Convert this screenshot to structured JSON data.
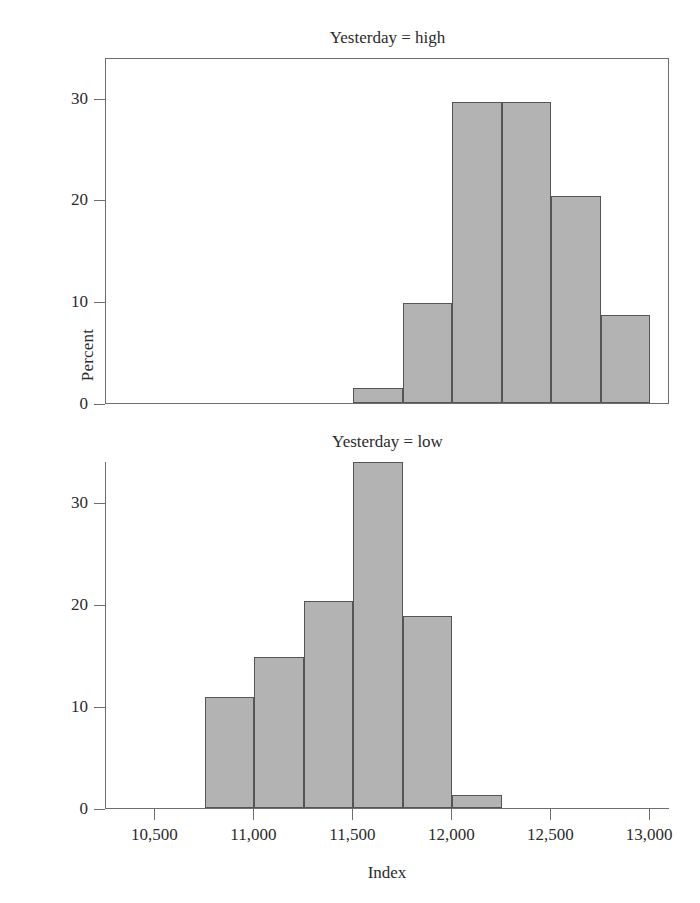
{
  "figure": {
    "xlabel": "Index",
    "ylabel": "Percent"
  },
  "chart_data": [
    {
      "type": "bar",
      "title": "Yesterday = high",
      "xlabel": "Index",
      "ylabel": "Percent",
      "xlim": [
        10250,
        13100
      ],
      "ylim": [
        0,
        34
      ],
      "xticks": [
        10500,
        11000,
        11500,
        12000,
        12500,
        13000
      ],
      "xticklabels": [
        "10,500",
        "11,000",
        "11,500",
        "12,000",
        "12,500",
        "13,000"
      ],
      "yticks": [
        0,
        10,
        20,
        30
      ],
      "yticklabels": [
        "0",
        "10",
        "20",
        "30"
      ],
      "grid": false,
      "legend": "none",
      "bin_width": 250,
      "bars": [
        {
          "x0": 11500,
          "x1": 11750,
          "value": 1.5
        },
        {
          "x0": 11750,
          "x1": 12000,
          "value": 9.8
        },
        {
          "x0": 12000,
          "x1": 12250,
          "value": 29.6
        },
        {
          "x0": 12250,
          "x1": 12500,
          "value": 29.6
        },
        {
          "x0": 12500,
          "x1": 12750,
          "value": 20.3
        },
        {
          "x0": 12750,
          "x1": 13000,
          "value": 8.6
        }
      ]
    },
    {
      "type": "bar",
      "title": "Yesterday = low",
      "xlabel": "Index",
      "ylabel": "Percent",
      "xlim": [
        10250,
        13100
      ],
      "ylim": [
        0,
        34
      ],
      "xticks": [
        10500,
        11000,
        11500,
        12000,
        12500,
        13000
      ],
      "xticklabels": [
        "10,500",
        "11,000",
        "11,500",
        "12,000",
        "12,500",
        "13,000"
      ],
      "yticks": [
        0,
        10,
        20,
        30
      ],
      "yticklabels": [
        "0",
        "10",
        "20",
        "30"
      ],
      "grid": false,
      "legend": "none",
      "bin_width": 250,
      "bars": [
        {
          "x0": 10750,
          "x1": 11000,
          "value": 10.9
        },
        {
          "x0": 11000,
          "x1": 11250,
          "value": 14.8
        },
        {
          "x0": 11250,
          "x1": 11500,
          "value": 20.3
        },
        {
          "x0": 11500,
          "x1": 11750,
          "value": 33.9
        },
        {
          "x0": 11750,
          "x1": 12000,
          "value": 18.8
        },
        {
          "x0": 12000,
          "x1": 12250,
          "value": 1.3
        }
      ]
    }
  ],
  "style": {
    "bar_fill": "#b3b3b3",
    "bar_edge": "#555555",
    "axis_color": "#6e6e6e",
    "text_color": "#2b2b2b",
    "background": "#ffffff"
  }
}
